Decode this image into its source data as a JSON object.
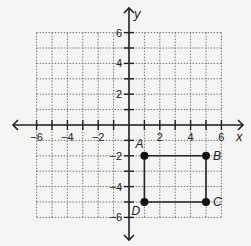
{
  "chart_data": {
    "type": "scatter",
    "title": "",
    "xlabel": "x",
    "ylabel": "y",
    "xlim": [
      -6,
      6
    ],
    "ylim": [
      -6,
      6
    ],
    "grid": true,
    "grid_style": "dotted",
    "x_tick_labels": [
      "-6",
      "-4",
      "-2",
      "2",
      "4",
      "6"
    ],
    "y_tick_labels": [
      "6",
      "4",
      "2",
      "-2",
      "-4",
      "-6"
    ],
    "points": [
      {
        "label": "A",
        "x": 1,
        "y": -2
      },
      {
        "label": "B",
        "x": 5,
        "y": -2
      },
      {
        "label": "C",
        "x": 5,
        "y": -5
      },
      {
        "label": "D",
        "x": 1,
        "y": -5
      }
    ],
    "polygon": [
      "A",
      "B",
      "C",
      "D"
    ],
    "shape": "rectangle ABCD"
  },
  "colors": {
    "background": "#f4f4f2",
    "grid": "#777777",
    "axis": "#222222",
    "points": "#111111"
  }
}
